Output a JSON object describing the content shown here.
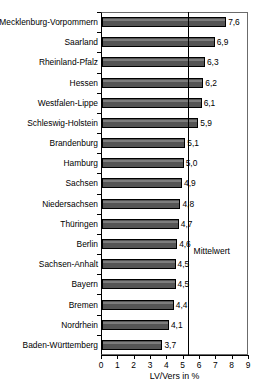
{
  "chart_data": {
    "type": "bar",
    "orientation": "horizontal",
    "title": "",
    "xlabel": "LV/Vers in %",
    "ylabel": "",
    "xlim": [
      0,
      9
    ],
    "xticks": [
      "0",
      "1",
      "2",
      "3",
      "4",
      "5",
      "6",
      "7",
      "8",
      "9"
    ],
    "grid": false,
    "legend": null,
    "categories": [
      "Mecklenburg-Vorpommern",
      "Saarland",
      "Rheinland-Pfalz",
      "Hessen",
      "Westfalen-Lippe",
      "Schleswig-Holstein",
      "Brandenburg",
      "Hamburg",
      "Sachsen",
      "Niedersachsen",
      "Thüringen",
      "Berlin",
      "Sachsen-Anhalt",
      "Bayern",
      "Bremen",
      "Nordrhein",
      "Baden-Württemberg"
    ],
    "values": [
      7.6,
      6.9,
      6.3,
      6.2,
      6.1,
      5.9,
      5.1,
      5.0,
      4.9,
      4.8,
      4.7,
      4.6,
      4.5,
      4.5,
      4.4,
      4.1,
      3.7
    ],
    "value_labels": [
      "7,6",
      "6,9",
      "6,3",
      "6,2",
      "6,1",
      "5,9",
      "5,1",
      "5,0",
      "4,9",
      "4,8",
      "4,7",
      "4,6",
      "4,5",
      "4,5",
      "4,4",
      "4,1",
      "3,7"
    ],
    "annotations": [
      {
        "name": "mean-line",
        "label": "Mittelwert",
        "value": 5.3,
        "type": "vertical-reference-line"
      }
    ],
    "colors": {
      "bar_fill": "#555555",
      "bar_highlight": "#7d7d7d",
      "bar_border": "#000000",
      "axis": "#000000",
      "frame": "#6b6b6b",
      "background": "#ffffff",
      "text": "#000000"
    }
  },
  "title_remnant": "",
  "mean_label": "Mittelwert"
}
